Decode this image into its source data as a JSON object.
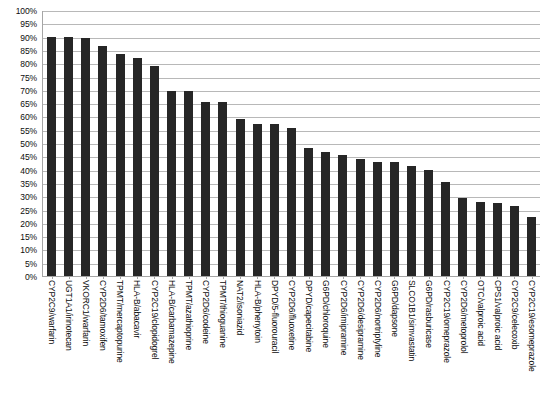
{
  "chart_data": {
    "type": "bar",
    "title": "",
    "subtitle": "",
    "xlabel": "",
    "ylabel": "",
    "ylim": [
      0,
      100
    ],
    "grid": true,
    "legend": false,
    "legend_position": "none",
    "value_unit": "%",
    "bar_color": "#262626",
    "gridline_color": "#b8b8b8",
    "axis_color": "#a6a6a6",
    "ytick_labels": [
      "100%",
      "95%",
      "90%",
      "85%",
      "80%",
      "75%",
      "70%",
      "65%",
      "60%",
      "55%",
      "50%",
      "45%",
      "40%",
      "35%",
      "30%",
      "25%",
      "20%",
      "15%",
      "10%",
      "5%",
      "0%"
    ],
    "ytick_values": [
      100,
      95,
      90,
      85,
      80,
      75,
      70,
      65,
      60,
      55,
      50,
      45,
      40,
      35,
      30,
      25,
      20,
      15,
      10,
      5,
      0
    ],
    "categories": [
      "CYP2C9/warfarin",
      "UGT1A1/irinotecan",
      "VKORC1/warfarin",
      "CYP2D6/tamoxifen",
      "TPMT/mercaptopurine",
      "HLA-B/abacavir",
      "CYP2C19/clopidogrel",
      "HLA-B/carbamazepine",
      "TPMT/azathioprine",
      "CYP2D6/codeine",
      "TPMT/thioguanine",
      "NAT2/isoniazid",
      "HLA-B/phenytoin",
      "DPYD/5-fluorouracil",
      "CYP2D6/fluoxetine",
      "DPYD/capecitabine",
      "G6PD/chloroquine",
      "CYP2D6/imipramine",
      "CYP2D6/desipramine",
      "CYP2D6/nortriptyline",
      "G6PD/dapsone",
      "SLCO1B1/simvastatin",
      "G6PD/rasburicase",
      "CYP2C19/omeprazole",
      "CYP2D6/metoprolol",
      "OTC/valproic acid",
      "CPS1/valproic acid",
      "CYP2C9/celecoxib",
      "CYP2C19/esomeprazole"
    ],
    "values": [
      90,
      90,
      89.5,
      86.5,
      83.5,
      82,
      79,
      69.5,
      69.5,
      65.5,
      65.5,
      59,
      57,
      57,
      55.5,
      48,
      46.5,
      45.5,
      44,
      43,
      43,
      41.5,
      40,
      35.5,
      29.5,
      28,
      27.5,
      26.5,
      26.5
    ],
    "bars": [
      {
        "label": "CYP2C9/warfarin",
        "value": 90
      },
      {
        "label": "UGT1A1/irinotecan",
        "value": 90
      },
      {
        "label": "VKORC1/warfarin",
        "value": 89.5
      },
      {
        "label": "CYP2D6/tamoxifen",
        "value": 86.5
      },
      {
        "label": "TPMT/mercaptopurine",
        "value": 83.5
      },
      {
        "label": "HLA-B/abacavir",
        "value": 82
      },
      {
        "label": "CYP2C19/clopidogrel",
        "value": 79
      },
      {
        "label": "HLA-B/carbamazepine",
        "value": 69.5
      },
      {
        "label": "TPMT/azathioprine",
        "value": 69.5
      },
      {
        "label": "CYP2D6/codeine",
        "value": 65.5
      },
      {
        "label": "TPMT/thioguanine",
        "value": 65.5
      },
      {
        "label": "NAT2/isoniazid",
        "value": 59
      },
      {
        "label": "HLA-B/phenytoin",
        "value": 57
      },
      {
        "label": "DPYD/5-fluorouracil",
        "value": 57
      },
      {
        "label": "CYP2D6/fluoxetine",
        "value": 55.5
      },
      {
        "label": "DPYD/capecitabine",
        "value": 48
      },
      {
        "label": "G6PD/chloroquine",
        "value": 46.5
      },
      {
        "label": "CYP2D6/imipramine",
        "value": 45.5
      },
      {
        "label": "CYP2D6/desipramine",
        "value": 44
      },
      {
        "label": "CYP2D6/nortriptyline",
        "value": 43
      },
      {
        "label": "G6PD/dapsone",
        "value": 43
      },
      {
        "label": "SLCO1B1/simvastatin",
        "value": 41.5
      },
      {
        "label": "G6PD/rasburicase",
        "value": 40
      },
      {
        "label": "CYP2C19/omeprazole",
        "value": 35.5
      },
      {
        "label": "CYP2D6/metoprolol",
        "value": 29.5
      },
      {
        "label": "OTC/valproic acid",
        "value": 28
      },
      {
        "label": "CPS1/valproic acid",
        "value": 27.5
      },
      {
        "label": "CYP2C9/celecoxib",
        "value": 26.5
      },
      {
        "label": "CYP2C19/esomeprazole",
        "value": 22
      }
    ]
  }
}
